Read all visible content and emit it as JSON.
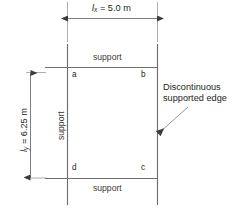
{
  "diagram": {
    "colors": {
      "line": "#6f6f6f",
      "text": "#231f20",
      "support_text": "#3a3a3a",
      "background": "#ffffff"
    },
    "dimensions": {
      "horizontal": {
        "symbol": "l",
        "subscript": "x",
        "equals": " = ",
        "value": "5.0",
        "unit": "m",
        "text": "lx = 5.0 m"
      },
      "vertical": {
        "symbol": "l",
        "subscript": "y",
        "equals": " = ",
        "value": "6.25",
        "unit": "m",
        "text": "ly = 6.25 m"
      }
    },
    "supports": {
      "top": "support",
      "left": "support",
      "bottom": "support"
    },
    "corners": {
      "top_left": "a",
      "top_right": "b",
      "bottom_right": "c",
      "bottom_left": "d"
    },
    "annotation": {
      "text": "Discontinuous supported edge",
      "line1": "Discontinuous",
      "line2": "supported edge"
    }
  }
}
